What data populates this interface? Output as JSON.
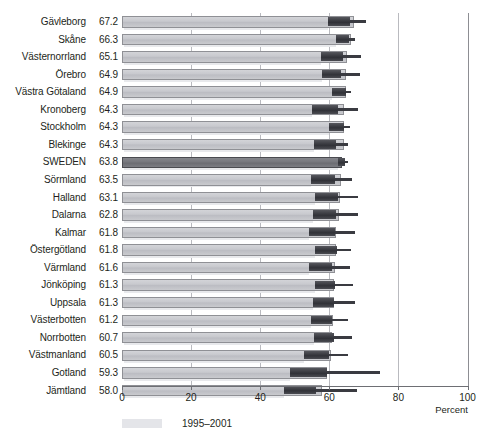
{
  "chart_data": {
    "type": "bar",
    "title": "",
    "subtitle": "",
    "xlabel": "Percent",
    "ylabel": "",
    "xlim": [
      0,
      100
    ],
    "xticks": [
      0,
      20,
      40,
      60,
      80,
      100
    ],
    "xticklabels": [
      "0",
      "20",
      "40",
      "60",
      "80",
      "100"
    ],
    "grid": true,
    "orientation": "horizontal",
    "legend": {
      "position": "bottom-left",
      "entries": [
        {
          "label": "1995–2001",
          "swatch_color": "#e4e5e9"
        }
      ]
    },
    "series": [
      {
        "name": "1995–2001",
        "kind": "bar",
        "color": "#c8c9ce",
        "highlight_color": "#76777d",
        "values": [
          67.2,
          66.3,
          65.1,
          64.9,
          64.9,
          64.3,
          64.3,
          64.3,
          63.8,
          63.5,
          63.1,
          62.8,
          61.8,
          61.8,
          61.6,
          61.3,
          61.3,
          61.2,
          60.7,
          60.5,
          59.3,
          58.0
        ]
      },
      {
        "name": "range-marker",
        "kind": "range",
        "color": "#3c3d43",
        "box_start": [
          59.5,
          61.9,
          57.5,
          58.0,
          60.8,
          55.0,
          59.8,
          55.5,
          62.6,
          54.8,
          56.0,
          55.2,
          54.2,
          55.8,
          54.0,
          56.0,
          55.4,
          54.6,
          55.6,
          52.6,
          48.6,
          47.0
        ],
        "box_end": [
          66.0,
          65.6,
          64.0,
          63.5,
          64.8,
          62.6,
          64.2,
          61.9,
          64.6,
          61.6,
          62.6,
          61.8,
          61.6,
          62.1,
          60.8,
          61.6,
          61.4,
          60.7,
          61.4,
          59.8,
          59.2,
          56.2
        ],
        "line_end": [
          70.5,
          67.5,
          69.3,
          68.8,
          66.4,
          68.3,
          65.9,
          65.5,
          65.5,
          66.5,
          68.4,
          68.3,
          67.4,
          66.3,
          66.0,
          67.0,
          67.3,
          65.5,
          66.7,
          65.4,
          74.8,
          68.0
        ]
      }
    ],
    "categories": [
      "Gävleborg",
      "Skåne",
      "Västernorrland",
      "Örebro",
      "Västra Götaland",
      "Kronoberg",
      "Stockholm",
      "Blekinge",
      "SWEDEN",
      "Sörmland",
      "Halland",
      "Dalarna",
      "Kalmar",
      "Östergötland",
      "Värmland",
      "Jönköping",
      "Uppsala",
      "Västerbotten",
      "Norrbotten",
      "Västmanland",
      "Gotland",
      "Jämtland"
    ],
    "value_labels": [
      "67.2",
      "66.3",
      "65.1",
      "64.9",
      "64.9",
      "64.3",
      "64.3",
      "64.3",
      "63.8",
      "63.5",
      "63.1",
      "62.8",
      "61.8",
      "61.8",
      "61.6",
      "61.3",
      "61.3",
      "61.2",
      "60.7",
      "60.5",
      "59.3",
      "58.0"
    ],
    "highlight_category": "SWEDEN",
    "rows": [
      {
        "label": "Gävleborg",
        "value_label": "67.2",
        "value": 67.2,
        "box_start": 59.5,
        "box_end": 66.0,
        "line_end": 70.5,
        "highlight": false
      },
      {
        "label": "Skåne",
        "value_label": "66.3",
        "value": 66.3,
        "box_start": 61.9,
        "box_end": 65.6,
        "line_end": 67.5,
        "highlight": false
      },
      {
        "label": "Västernorrland",
        "value_label": "65.1",
        "value": 65.1,
        "box_start": 57.5,
        "box_end": 64.0,
        "line_end": 69.3,
        "highlight": false
      },
      {
        "label": "Örebro",
        "value_label": "64.9",
        "value": 64.9,
        "box_start": 58.0,
        "box_end": 63.5,
        "line_end": 68.8,
        "highlight": false
      },
      {
        "label": "Västra Götaland",
        "value_label": "64.9",
        "value": 64.9,
        "box_start": 60.8,
        "box_end": 64.8,
        "line_end": 66.4,
        "highlight": false
      },
      {
        "label": "Kronoberg",
        "value_label": "64.3",
        "value": 64.3,
        "box_start": 55.0,
        "box_end": 62.6,
        "line_end": 68.3,
        "highlight": false
      },
      {
        "label": "Stockholm",
        "value_label": "64.3",
        "value": 64.3,
        "box_start": 59.8,
        "box_end": 64.2,
        "line_end": 65.9,
        "highlight": false
      },
      {
        "label": "Blekinge",
        "value_label": "64.3",
        "value": 64.3,
        "box_start": 55.5,
        "box_end": 61.9,
        "line_end": 65.5,
        "highlight": false
      },
      {
        "label": "SWEDEN",
        "value_label": "63.8",
        "value": 63.8,
        "box_start": 62.6,
        "box_end": 64.6,
        "line_end": 65.5,
        "highlight": true
      },
      {
        "label": "Sörmland",
        "value_label": "63.5",
        "value": 63.5,
        "box_start": 54.8,
        "box_end": 61.6,
        "line_end": 66.5,
        "highlight": false
      },
      {
        "label": "Halland",
        "value_label": "63.1",
        "value": 63.1,
        "box_start": 56.0,
        "box_end": 62.6,
        "line_end": 68.4,
        "highlight": false
      },
      {
        "label": "Dalarna",
        "value_label": "62.8",
        "value": 62.8,
        "box_start": 55.2,
        "box_end": 61.8,
        "line_end": 68.3,
        "highlight": false
      },
      {
        "label": "Kalmar",
        "value_label": "61.8",
        "value": 61.8,
        "box_start": 54.2,
        "box_end": 61.6,
        "line_end": 67.4,
        "highlight": false
      },
      {
        "label": "Östergötland",
        "value_label": "61.8",
        "value": 61.8,
        "box_start": 55.8,
        "box_end": 62.1,
        "line_end": 66.3,
        "highlight": false
      },
      {
        "label": "Värmland",
        "value_label": "61.6",
        "value": 61.6,
        "box_start": 54.0,
        "box_end": 60.8,
        "line_end": 66.0,
        "highlight": false
      },
      {
        "label": "Jönköping",
        "value_label": "61.3",
        "value": 61.3,
        "box_start": 56.0,
        "box_end": 61.6,
        "line_end": 67.0,
        "highlight": false
      },
      {
        "label": "Uppsala",
        "value_label": "61.3",
        "value": 61.3,
        "box_start": 55.4,
        "box_end": 61.4,
        "line_end": 67.3,
        "highlight": false
      },
      {
        "label": "Västerbotten",
        "value_label": "61.2",
        "value": 61.2,
        "box_start": 54.6,
        "box_end": 60.7,
        "line_end": 65.5,
        "highlight": false
      },
      {
        "label": "Norrbotten",
        "value_label": "60.7",
        "value": 60.7,
        "box_start": 55.6,
        "box_end": 61.4,
        "line_end": 66.7,
        "highlight": false
      },
      {
        "label": "Västmanland",
        "value_label": "60.5",
        "value": 60.5,
        "box_start": 52.6,
        "box_end": 59.8,
        "line_end": 65.4,
        "highlight": false
      },
      {
        "label": "Gotland",
        "value_label": "59.3",
        "value": 59.3,
        "box_start": 48.6,
        "box_end": 59.2,
        "line_end": 74.8,
        "highlight": false
      },
      {
        "label": "Jämtland",
        "value_label": "58.0",
        "value": 58.0,
        "box_start": 47.0,
        "box_end": 56.2,
        "line_end": 68.0,
        "highlight": false
      }
    ]
  }
}
